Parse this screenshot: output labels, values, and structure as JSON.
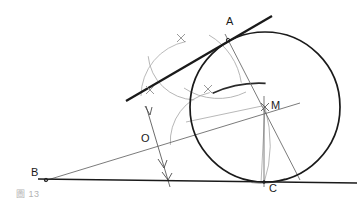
{
  "figure": {
    "caption": "圖 13",
    "width": 357,
    "height": 212,
    "background": "#ffffff"
  },
  "colors": {
    "primary_stroke": "#1a1a1a",
    "construction_stroke": "#8c8c8c",
    "thin_stroke": "#5a5a5a",
    "label_text": "#1a1a1a",
    "caption_text": "#9a9a9a"
  },
  "points": [
    {
      "id": "A",
      "label": "A",
      "x": 228,
      "y": 40,
      "label_x": 226,
      "label_y": 22,
      "role": "tangency-point-on-bold-line"
    },
    {
      "id": "B",
      "label": "B",
      "x": 46,
      "y": 180,
      "label_x": 32,
      "label_y": 168,
      "role": "angle-vertex"
    },
    {
      "id": "C",
      "label": "C",
      "x": 264,
      "y": 182,
      "label_x": 269,
      "label_y": 184,
      "role": "tangency-point-on-baseline"
    },
    {
      "id": "M",
      "label": "M",
      "x": 265,
      "y": 107,
      "label_x": 271,
      "label_y": 101,
      "role": "circle-center"
    },
    {
      "id": "O",
      "label": "O",
      "x": 152,
      "y": 143,
      "label_x": 142,
      "label_y": 134,
      "role": "point-on-bisector"
    }
  ],
  "circle": {
    "id": "main-circle",
    "center_x": 265,
    "center_y": 107,
    "radius": 75,
    "stroke": "#1a1a1a",
    "stroke_width": 1.6
  },
  "lines": [
    {
      "id": "baseline-BC",
      "label": "baseline through B and C",
      "x1": 40,
      "y1": 179,
      "x2": 357,
      "y2": 183,
      "stroke": "#1a1a1a",
      "stroke_width": 1.5
    },
    {
      "id": "tangent-line-A",
      "label": "bold tangent line through A",
      "x1": 126,
      "y1": 101,
      "x2": 272,
      "y2": 16,
      "stroke": "#1a1a1a",
      "stroke_width": 2.2
    },
    {
      "id": "bisector-BM",
      "label": "angle bisector from B through O to M",
      "x1": 44,
      "y1": 181,
      "x2": 300,
      "y2": 104,
      "stroke": "#5a5a5a",
      "stroke_width": 0.8
    },
    {
      "id": "radius-AM-extended",
      "label": "line from A through M to circle",
      "x1": 226,
      "y1": 36,
      "x2": 299,
      "y2": 179,
      "stroke": "#5a5a5a",
      "stroke_width": 0.8
    },
    {
      "id": "radius-MC",
      "label": "radius from M down to C",
      "x1": 264,
      "y1": 98,
      "x2": 264,
      "y2": 186,
      "stroke": "#5a5a5a",
      "stroke_width": 0.8
    },
    {
      "id": "perpendicular-at-O",
      "label": "perpendicular transversal through O",
      "x1": 146,
      "y1": 106,
      "x2": 170,
      "y2": 186,
      "stroke": "#5a5a5a",
      "stroke_width": 0.9
    },
    {
      "id": "chord-left-M",
      "label": "light chord from left toward M",
      "x1": 186,
      "y1": 122,
      "x2": 262,
      "y2": 106,
      "stroke": "#8c8c8c",
      "stroke_width": 0.7
    },
    {
      "id": "short-segment-MC-slant",
      "label": "slanted segment from M to C",
      "x1": 265,
      "y1": 107,
      "x2": 261,
      "y2": 183,
      "stroke": "#8c8c8c",
      "stroke_width": 0.7
    }
  ],
  "construction_arcs": [
    {
      "id": "arc-upper-left",
      "label": "compass arc upper left",
      "cx": 160,
      "cy": 96,
      "r": 50,
      "start_deg": 282,
      "end_deg": 355,
      "stroke": "#a0a0a0"
    },
    {
      "id": "arc-lower-left",
      "label": "compass arc lower left",
      "cx": 196,
      "cy": 52,
      "r": 48,
      "start_deg": 92,
      "end_deg": 175,
      "stroke": "#a0a0a0"
    },
    {
      "id": "arc-mid-right",
      "label": "compass arc toward tangent point",
      "cx": 176,
      "cy": 92,
      "r": 66,
      "start_deg": 300,
      "end_deg": 352,
      "stroke": "#a0a0a0"
    },
    {
      "id": "arc-near-C",
      "label": "small compass arc near C",
      "cx": 262,
      "cy": 122,
      "r": 61,
      "start_deg": 68,
      "end_deg": 100,
      "stroke": "#8c8c8c"
    },
    {
      "id": "arc-bold-partial",
      "label": "bold partial arc near tangency",
      "cx": 172,
      "cy": 188,
      "r": 112,
      "start_deg": 238,
      "end_deg": 298,
      "stroke": "#1a1a1a"
    }
  ],
  "cross_marks": [
    {
      "id": "cross-top",
      "label": "arc intersection mark top",
      "x": 181,
      "y": 38,
      "size": 6
    },
    {
      "id": "cross-left",
      "label": "arc intersection mark left",
      "x": 150,
      "y": 90,
      "size": 6
    },
    {
      "id": "cross-mid",
      "label": "arc intersection mark middle",
      "x": 208,
      "y": 89,
      "size": 6
    },
    {
      "id": "cross-near-m",
      "label": "arc intersection mark near M",
      "x": 265,
      "y": 107,
      "size": 6
    }
  ],
  "tick_marks": [
    {
      "id": "tick-upper",
      "label": "direction tick upper on transversal",
      "x": 150,
      "y": 112
    },
    {
      "id": "tick-lower",
      "label": "direction tick lower on transversal",
      "x": 164,
      "y": 166
    },
    {
      "id": "tick-baseline",
      "label": "direction tick at baseline crossing",
      "x": 168,
      "y": 180
    }
  ]
}
